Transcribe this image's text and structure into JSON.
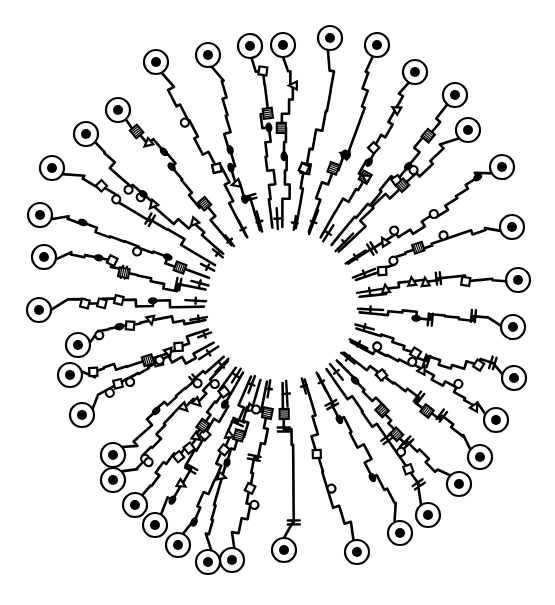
{
  "artwork": {
    "description": "Hand-drawn radial circuit-style line drawing: many wiggly traces radiating outward from an empty central circle, each ending in a ring terminal with a filled dot.",
    "colors": {
      "ink": "#000000",
      "paper": "#ffffff"
    },
    "center": {
      "x": 282,
      "y": 305
    },
    "inner_radius": 74,
    "terminals": [
      {
        "x": 156,
        "y": 62
      },
      {
        "x": 208,
        "y": 55
      },
      {
        "x": 250,
        "y": 46
      },
      {
        "x": 283,
        "y": 45
      },
      {
        "x": 330,
        "y": 38
      },
      {
        "x": 377,
        "y": 45
      },
      {
        "x": 415,
        "y": 72
      },
      {
        "x": 455,
        "y": 95
      },
      {
        "x": 468,
        "y": 130
      },
      {
        "x": 502,
        "y": 167
      },
      {
        "x": 512,
        "y": 227
      },
      {
        "x": 518,
        "y": 280
      },
      {
        "x": 513,
        "y": 327
      },
      {
        "x": 514,
        "y": 378
      },
      {
        "x": 496,
        "y": 420
      },
      {
        "x": 480,
        "y": 457
      },
      {
        "x": 459,
        "y": 484
      },
      {
        "x": 428,
        "y": 515
      },
      {
        "x": 400,
        "y": 533
      },
      {
        "x": 357,
        "y": 552
      },
      {
        "x": 284,
        "y": 550
      },
      {
        "x": 232,
        "y": 560
      },
      {
        "x": 208,
        "y": 562
      },
      {
        "x": 178,
        "y": 545
      },
      {
        "x": 155,
        "y": 525
      },
      {
        "x": 135,
        "y": 505
      },
      {
        "x": 113,
        "y": 480
      },
      {
        "x": 113,
        "y": 455
      },
      {
        "x": 82,
        "y": 415
      },
      {
        "x": 70,
        "y": 375
      },
      {
        "x": 78,
        "y": 345
      },
      {
        "x": 39,
        "y": 310
      },
      {
        "x": 44,
        "y": 257
      },
      {
        "x": 40,
        "y": 215
      },
      {
        "x": 52,
        "y": 168
      },
      {
        "x": 86,
        "y": 134
      },
      {
        "x": 118,
        "y": 110
      }
    ],
    "short_spokes_count": 30,
    "terminal_ring_radius": 12,
    "terminal_dot_radius": 5,
    "motifs": [
      "capacitor",
      "hatched-box",
      "loop",
      "square",
      "triangle",
      "filled-oval"
    ]
  }
}
